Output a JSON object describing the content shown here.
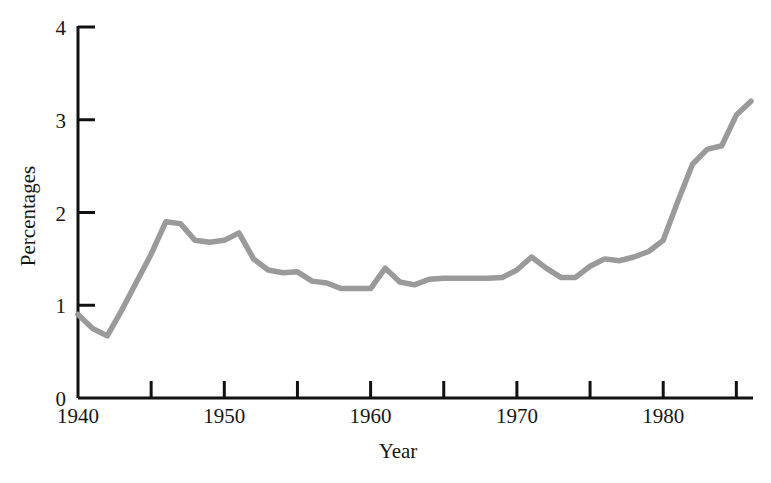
{
  "chart_data": {
    "type": "line",
    "title": "",
    "xlabel": "Year",
    "ylabel": "Percentages",
    "xlim": [
      1940,
      1986
    ],
    "ylim": [
      0,
      4
    ],
    "grid": false,
    "legend": null,
    "line_color": "#9a9a9a",
    "axis_color": "#111111",
    "x_major_ticks": [
      1940,
      1950,
      1960,
      1970,
      1980
    ],
    "x_major_tick_labels": [
      "1940",
      "1950",
      "1960",
      "1970",
      "1980"
    ],
    "x_minor_ticks": [
      1945,
      1955,
      1965,
      1975,
      1985
    ],
    "y_ticks": [
      0,
      1,
      2,
      3,
      4
    ],
    "y_tick_labels": [
      "0",
      "1",
      "2",
      "3",
      "4"
    ],
    "series": [
      {
        "name": "Percentages",
        "x": [
          1940,
          1941,
          1942,
          1943,
          1944,
          1945,
          1946,
          1947,
          1948,
          1949,
          1950,
          1951,
          1952,
          1953,
          1954,
          1955,
          1956,
          1957,
          1958,
          1959,
          1960,
          1961,
          1962,
          1963,
          1964,
          1965,
          1966,
          1967,
          1968,
          1969,
          1970,
          1971,
          1972,
          1973,
          1974,
          1975,
          1976,
          1977,
          1978,
          1979,
          1980,
          1981,
          1982,
          1983,
          1984,
          1985,
          1986
        ],
        "values": [
          0.9,
          0.75,
          0.67,
          0.95,
          1.25,
          1.55,
          1.9,
          1.88,
          1.7,
          1.68,
          1.7,
          1.78,
          1.5,
          1.38,
          1.35,
          1.36,
          1.26,
          1.24,
          1.18,
          1.18,
          1.18,
          1.4,
          1.25,
          1.22,
          1.28,
          1.29,
          1.29,
          1.29,
          1.29,
          1.3,
          1.38,
          1.52,
          1.4,
          1.3,
          1.3,
          1.42,
          1.5,
          1.48,
          1.52,
          1.58,
          1.7,
          2.12,
          2.52,
          2.68,
          2.72,
          3.05,
          3.2
        ]
      }
    ]
  },
  "labels": {
    "y_axis_title": "Percentages",
    "x_axis_title": "Year"
  }
}
